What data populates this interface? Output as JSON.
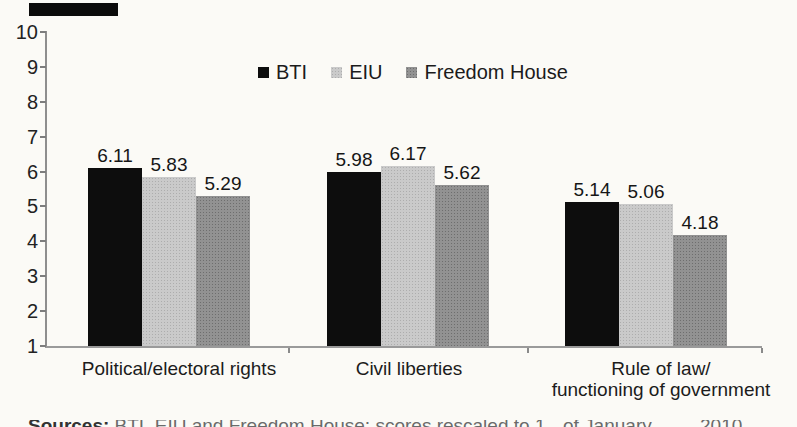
{
  "figure": {
    "kind": "scanned book figure, bar chart, no title visible",
    "background": "#fbfaf6",
    "accent_colors": {
      "bti_black": "#0d0d0d",
      "eiu_light_gray": "#cacaca",
      "freedom_house_gray": "#929292",
      "axis_gray": "#8e8e8e"
    }
  },
  "chart_data": {
    "type": "bar",
    "title": "",
    "xlabel": "",
    "ylabel": "",
    "ylim": [
      1,
      10
    ],
    "yticks": [
      10,
      9,
      8,
      7,
      6,
      5,
      4,
      3,
      2,
      1
    ],
    "grid": false,
    "legend_position": "top-center",
    "data_labels": true,
    "categories": [
      "Political/electoral rights",
      "Civil liberties",
      "Rule of law/ functioning of government"
    ],
    "category_label_lines": [
      [
        "Political/electoral rights"
      ],
      [
        "Civil liberties"
      ],
      [
        "Rule of law/",
        "functioning of government"
      ]
    ],
    "series": [
      {
        "name": "BTI",
        "color": "#0d0d0d",
        "values": [
          6.11,
          5.98,
          5.14
        ]
      },
      {
        "name": "EIU",
        "color": "#cacaca",
        "values": [
          5.83,
          6.17,
          5.06
        ]
      },
      {
        "name": "Freedom House",
        "color": "#929292",
        "values": [
          5.29,
          5.62,
          4.18
        ]
      }
    ]
  },
  "caption_sliver": {
    "clipped": true,
    "legible_fragments": [
      "of January",
      "2010"
    ],
    "illegible_text_left": "Sources: BTI, EIU and Freedom House; scores rescaled to 1–10, as"
  }
}
